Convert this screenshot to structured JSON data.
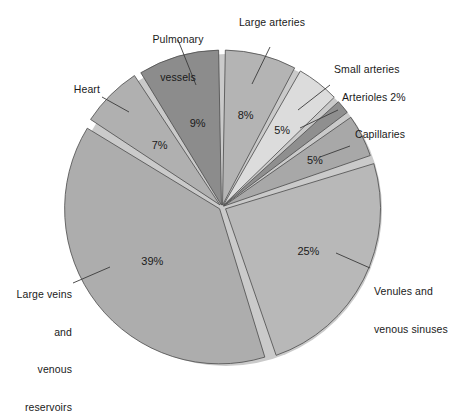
{
  "chart_data": {
    "type": "pie",
    "title": "",
    "subtitle": "",
    "xlabel": "",
    "ylabel": "",
    "legend_position": "callout-labels",
    "grid": false,
    "units": "percent",
    "total": 100,
    "start_angle_deg": 0,
    "direction": "clockwise",
    "categories": [
      "Large arteries",
      "Small arteries",
      "Arterioles",
      "Capillaries",
      "Venules and venous sinuses",
      "Large veins and venous reservoirs",
      "Heart",
      "Pulmonary vessels"
    ],
    "values": [
      8,
      5,
      2,
      5,
      25,
      39,
      7,
      9
    ],
    "slices": [
      {
        "id": "large-arteries",
        "label": "Large arteries",
        "label_lines": [
          "Large arteries"
        ],
        "value": 8,
        "value_text": "8%",
        "value_inside": true,
        "color": "#b4b4b4"
      },
      {
        "id": "small-arteries",
        "label": "Small arteries",
        "label_lines": [
          "Small arteries"
        ],
        "value": 5,
        "value_text": "5%",
        "value_inside": true,
        "color": "#dcdcdc"
      },
      {
        "id": "arterioles",
        "label": "Arterioles 2%",
        "label_lines": [
          "Arterioles 2%"
        ],
        "value": 2,
        "value_text": "2%",
        "value_inside": false,
        "color": "#8f8f8f"
      },
      {
        "id": "capillaries",
        "label": "Capillaries",
        "label_lines": [
          "Capillaries"
        ],
        "value": 5,
        "value_text": "5%",
        "value_inside": true,
        "color": "#a8a8a8"
      },
      {
        "id": "venules-venous-sinuses",
        "label": "Venules and venous sinuses",
        "label_lines": [
          "Venules and",
          "venous sinuses"
        ],
        "value": 25,
        "value_text": "25%",
        "value_inside": true,
        "color": "#b8b8b8"
      },
      {
        "id": "large-veins-venous-reservoirs",
        "label": "Large veins and venous reservoirs",
        "label_lines": [
          "Large veins",
          "and",
          "venous",
          "reservoirs"
        ],
        "value": 39,
        "value_text": "39%",
        "value_inside": true,
        "color": "#adadad"
      },
      {
        "id": "heart",
        "label": "Heart",
        "label_lines": [
          "Heart"
        ],
        "value": 7,
        "value_text": "7%",
        "value_inside": true,
        "color": "#b0b0b0"
      },
      {
        "id": "pulmonary-vessels",
        "label": "Pulmonary vessels",
        "label_lines": [
          "Pulmonary",
          "vessels"
        ],
        "value": 9,
        "value_text": "9%",
        "value_inside": true,
        "color": "#8c8c8c"
      }
    ]
  },
  "labels": {
    "pulmonary_vessels_l1": "Pulmonary",
    "pulmonary_vessels_l2": "vessels",
    "large_arteries": "Large arteries",
    "small_arteries": "Small arteries",
    "arterioles": "Arterioles 2%",
    "capillaries": "Capillaries",
    "venules_l1": "Venules and",
    "venules_l2": "venous sinuses",
    "large_veins_l1": "Large veins",
    "large_veins_l2": "and",
    "large_veins_l3": "venous",
    "large_veins_l4": "reservoirs",
    "heart": "Heart"
  },
  "values": {
    "pulmonary_vessels": "9%",
    "large_arteries": "8%",
    "small_arteries": "5%",
    "capillaries": "5%",
    "venules": "25%",
    "large_veins": "39%",
    "heart": "7%"
  },
  "colors": {
    "background": "#ffffff",
    "text": "#1a1a1a",
    "outline": "#4a4a4a",
    "leader": "#3a3a3a",
    "shadow": "#c9c9c9"
  }
}
